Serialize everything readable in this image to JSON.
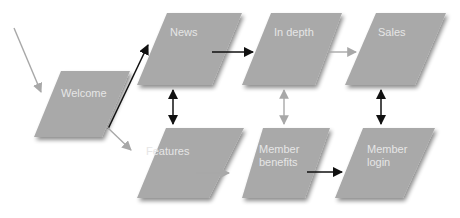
{
  "diagram": {
    "colors": {
      "node_fill": "#a9a9a9",
      "node_text": "#e6e6e6",
      "arrow_strong": "#111111",
      "arrow_light": "#a8a8a8",
      "background": "#ffffff"
    },
    "nodes": [
      {
        "id": "welcome",
        "label": "Welcome"
      },
      {
        "id": "news",
        "label": "News"
      },
      {
        "id": "in_depth",
        "label": "In depth"
      },
      {
        "id": "sales",
        "label": "Sales"
      },
      {
        "id": "features",
        "label": "Features"
      },
      {
        "id": "member_benefits",
        "label": "Member\nbenefits"
      },
      {
        "id": "member_login",
        "label": "Member\nlogin"
      }
    ],
    "edges": [
      {
        "from": "entry",
        "to": "welcome",
        "style": "light",
        "direction": "forward"
      },
      {
        "from": "welcome",
        "to": "news",
        "style": "strong",
        "direction": "forward"
      },
      {
        "from": "welcome",
        "to": "features",
        "style": "light",
        "direction": "forward"
      },
      {
        "from": "news",
        "to": "in_depth",
        "style": "strong",
        "direction": "forward"
      },
      {
        "from": "in_depth",
        "to": "sales",
        "style": "light",
        "direction": "forward"
      },
      {
        "from": "news",
        "to": "features",
        "style": "strong",
        "direction": "both"
      },
      {
        "from": "in_depth",
        "to": "member_benefits",
        "style": "light",
        "direction": "both"
      },
      {
        "from": "sales",
        "to": "member_login",
        "style": "strong",
        "direction": "both"
      },
      {
        "from": "features",
        "to": "member_benefits",
        "style": "light",
        "direction": "forward"
      },
      {
        "from": "member_benefits",
        "to": "member_login",
        "style": "strong",
        "direction": "forward"
      }
    ]
  }
}
